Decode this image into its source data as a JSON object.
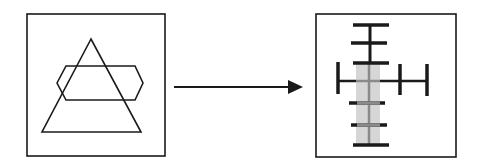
{
  "diagram": {
    "colors": {
      "background": "#ffffff",
      "stroke": "#1a1a1a",
      "shade": "#d6d6d6",
      "center_line": "#8a8a8a"
    },
    "left_panel": {
      "label": "",
      "shapes": [
        "triangle",
        "hexagon"
      ]
    },
    "arrow": {
      "direction": "right"
    },
    "right_panel": {
      "label": "",
      "shapes": [
        "vertical-stem",
        "horizontal-bars",
        "shaded-column",
        "horizontal-arm",
        "end-caps"
      ]
    }
  }
}
